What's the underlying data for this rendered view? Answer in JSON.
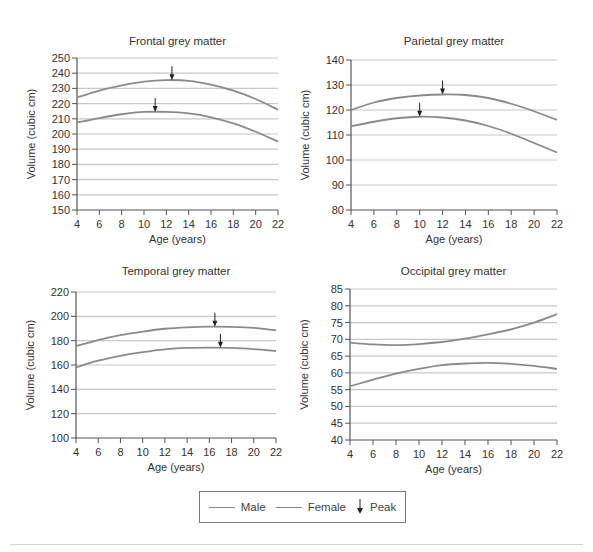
{
  "legend": {
    "male_label": "Male",
    "female_label": "Female",
    "peak_label": "Peak",
    "peak_icon": "down-arrow-icon"
  },
  "colors": {
    "line": "#8a8a8a",
    "grid": "#c8c8c8",
    "axis": "#555555",
    "arrow": "#222222"
  },
  "chart_data": [
    {
      "type": "line",
      "title": "Frontal grey matter",
      "xlabel": "Age (years)",
      "ylabel": "Volume (cubic cm)",
      "x": [
        4,
        6,
        8,
        10,
        12,
        14,
        16,
        18,
        20,
        22
      ],
      "xlim": [
        4,
        22
      ],
      "ylim": [
        150,
        250
      ],
      "yticks": [
        150,
        160,
        170,
        180,
        190,
        200,
        210,
        220,
        230,
        240,
        250
      ],
      "grid": true,
      "series": [
        {
          "name": "Male",
          "values": [
            224,
            228.5,
            232,
            234.5,
            235.5,
            235,
            232.5,
            228.5,
            223,
            216
          ],
          "peak_age": 12.5
        },
        {
          "name": "Female",
          "values": [
            207.5,
            210.5,
            213,
            214.5,
            214.5,
            213.5,
            211,
            207,
            201.5,
            195
          ],
          "peak_age": 11
        }
      ]
    },
    {
      "type": "line",
      "title": "Parietal grey matter",
      "xlabel": "Age (years)",
      "ylabel": "Volume (cubic cm)",
      "x": [
        4,
        6,
        8,
        10,
        12,
        14,
        16,
        18,
        20,
        22
      ],
      "xlim": [
        4,
        22
      ],
      "ylim": [
        80,
        140
      ],
      "yticks": [
        80,
        90,
        100,
        110,
        120,
        130,
        140
      ],
      "grid": true,
      "series": [
        {
          "name": "Male",
          "values": [
            120,
            123,
            124.8,
            125.8,
            126.2,
            126,
            124.8,
            122.5,
            119.5,
            116
          ],
          "peak_age": 12
        },
        {
          "name": "Female",
          "values": [
            113.5,
            115.3,
            116.7,
            117.3,
            117,
            115.8,
            113.6,
            110.5,
            106.8,
            103
          ],
          "peak_age": 10
        }
      ]
    },
    {
      "type": "line",
      "title": "Temporal grey matter",
      "xlabel": "Age (years)",
      "ylabel": "Volume (cubic cm)",
      "x": [
        4,
        6,
        8,
        10,
        12,
        14,
        16,
        18,
        20,
        22
      ],
      "xlim": [
        4,
        22
      ],
      "ylim": [
        100,
        220
      ],
      "yticks": [
        100,
        120,
        140,
        160,
        180,
        200,
        220
      ],
      "grid": true,
      "series": [
        {
          "name": "Male",
          "values": [
            175.5,
            180.5,
            184.5,
            187.5,
            189.8,
            191,
            191.5,
            191.3,
            190.5,
            188.5
          ],
          "peak_age": 16.5
        },
        {
          "name": "Female",
          "values": [
            158,
            163.5,
            167.5,
            170.5,
            172.8,
            174,
            174.3,
            174,
            173,
            171.5
          ],
          "peak_age": 17
        }
      ]
    },
    {
      "type": "line",
      "title": "Occipital grey matter",
      "xlabel": "Age (years)",
      "ylabel": "Volume (cubic cm)",
      "x": [
        4,
        6,
        8,
        10,
        12,
        14,
        16,
        18,
        20,
        22
      ],
      "xlim": [
        4,
        22
      ],
      "ylim": [
        40,
        85
      ],
      "yticks": [
        40,
        45,
        50,
        55,
        60,
        65,
        70,
        75,
        80,
        85
      ],
      "grid": true,
      "series": [
        {
          "name": "Male",
          "values": [
            69,
            68.5,
            68.3,
            68.6,
            69.2,
            70.2,
            71.5,
            73,
            75,
            77.5
          ]
        },
        {
          "name": "Female",
          "values": [
            56,
            58,
            59.8,
            61.2,
            62.3,
            62.8,
            63,
            62.7,
            62.1,
            61.2
          ]
        }
      ]
    }
  ]
}
